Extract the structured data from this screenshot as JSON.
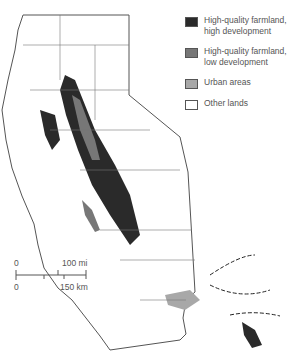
{
  "legend": {
    "items": [
      {
        "label": "High-quality farmland,\nhigh development",
        "color": "#2a2a2a"
      },
      {
        "label": "High-quality farmland,\nlow development",
        "color": "#777777"
      },
      {
        "label": "Urban areas",
        "color": "#a8a8a8"
      },
      {
        "label": "Other lands",
        "color": "#ffffff"
      }
    ]
  },
  "scale": {
    "top_zero": "0",
    "top_max": "100 mi",
    "bottom_zero": "0",
    "bottom_max": "150 km"
  },
  "colors": {
    "outline": "#555555",
    "county_lines": "#777777",
    "background": "#ffffff"
  }
}
